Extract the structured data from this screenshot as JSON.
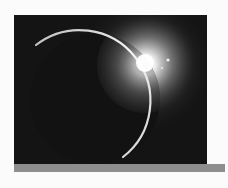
{
  "image": {
    "subject": "eclipse-sunrise-over-planet",
    "description": "Dark planet silhouette with thin bright crescent rim and sun flare at upper right",
    "colors": {
      "page_background": "#fbfbfb",
      "space": "#141414",
      "rim": "#e8e8e8",
      "flare": "#ffffff",
      "bar": "#8e8e8e"
    }
  },
  "footer_bar": {
    "color": "#8e8e8e"
  }
}
